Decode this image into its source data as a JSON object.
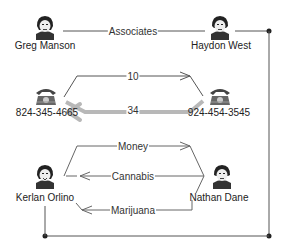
{
  "diagram": {
    "type": "link-analysis",
    "nodes": [
      {
        "id": "greg",
        "kind": "person",
        "label": "Greg Manson"
      },
      {
        "id": "haydon",
        "kind": "person",
        "label": "Haydon West"
      },
      {
        "id": "phone1",
        "kind": "phone",
        "label": "824-345-4665"
      },
      {
        "id": "phone2",
        "kind": "phone",
        "label": "924-454-3545"
      },
      {
        "id": "kerlan",
        "kind": "person",
        "label": "Kerlan Orlino"
      },
      {
        "id": "nathan",
        "kind": "person",
        "label": "Nathan Dane"
      }
    ],
    "edges": [
      {
        "from": "greg",
        "to": "haydon",
        "label": "Associates",
        "directed": false
      },
      {
        "from": "phone1",
        "to": "phone2",
        "label": "10",
        "directed": true
      },
      {
        "from": "phone2",
        "to": "phone1",
        "label": "34",
        "directed": true,
        "emphasis": "thick"
      },
      {
        "from": "kerlan",
        "to": "nathan",
        "label": "Money",
        "directed": true
      },
      {
        "from": "nathan",
        "to": "kerlan",
        "label": "Cannabis",
        "directed": true
      },
      {
        "from": "nathan",
        "to": "kerlan",
        "label": "Marijuana",
        "directed": true
      },
      {
        "from": "haydon",
        "to": "kerlan",
        "label": "",
        "directed": false,
        "style": "elbow-connector"
      }
    ],
    "colors": {
      "line": "#555555",
      "thick_line": "#b8b8b8",
      "text": "#222222"
    }
  }
}
